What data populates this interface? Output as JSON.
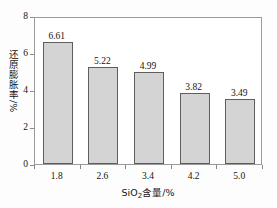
{
  "chart_data": {
    "type": "bar",
    "title": "",
    "categories": [
      "1.8",
      "2.6",
      "3.4",
      "4.2",
      "5.0"
    ],
    "values": [
      6.61,
      5.22,
      4.99,
      3.82,
      3.49
    ],
    "value_labels": [
      "6.61",
      "5.22",
      "4.99",
      "3.82",
      "3.49"
    ],
    "xlabel_prefix": "SiO",
    "xlabel_sub": "2",
    "xlabel_suffix": "含量/%",
    "xlabel_full": "SiO2含量/%",
    "ylabel": "还原膨胀率",
    "ylabel_unit": "/%",
    "ylim": [
      0,
      8
    ],
    "yticks": [
      "0",
      "2",
      "4",
      "6",
      "8"
    ],
    "ytick_values": [
      0,
      2,
      4,
      6,
      8
    ],
    "grid": false,
    "legend": false,
    "bar_fill_color": "#d4d4d4",
    "bar_edge_color": "#5e5e5e",
    "frame_color": "#9a9a9a",
    "background_color": "#ffffff"
  }
}
